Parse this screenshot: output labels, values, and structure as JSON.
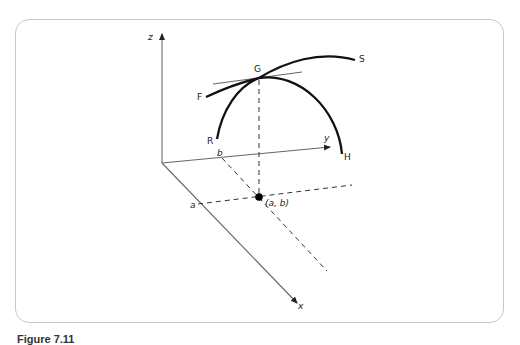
{
  "figure": {
    "axes": {
      "z_label": "z",
      "y_label": "y",
      "x_label": "x"
    },
    "points": {
      "G": "G",
      "F": "F",
      "S": "S",
      "R": "R",
      "H": "H",
      "a": "a",
      "b": "b",
      "ab": "(a, b)"
    },
    "colors": {
      "axis": "#555555",
      "curve": "#111111",
      "frame": "#c8c8c8",
      "tangent": "#666666"
    }
  },
  "caption": {
    "text": "Figure 7.11"
  }
}
